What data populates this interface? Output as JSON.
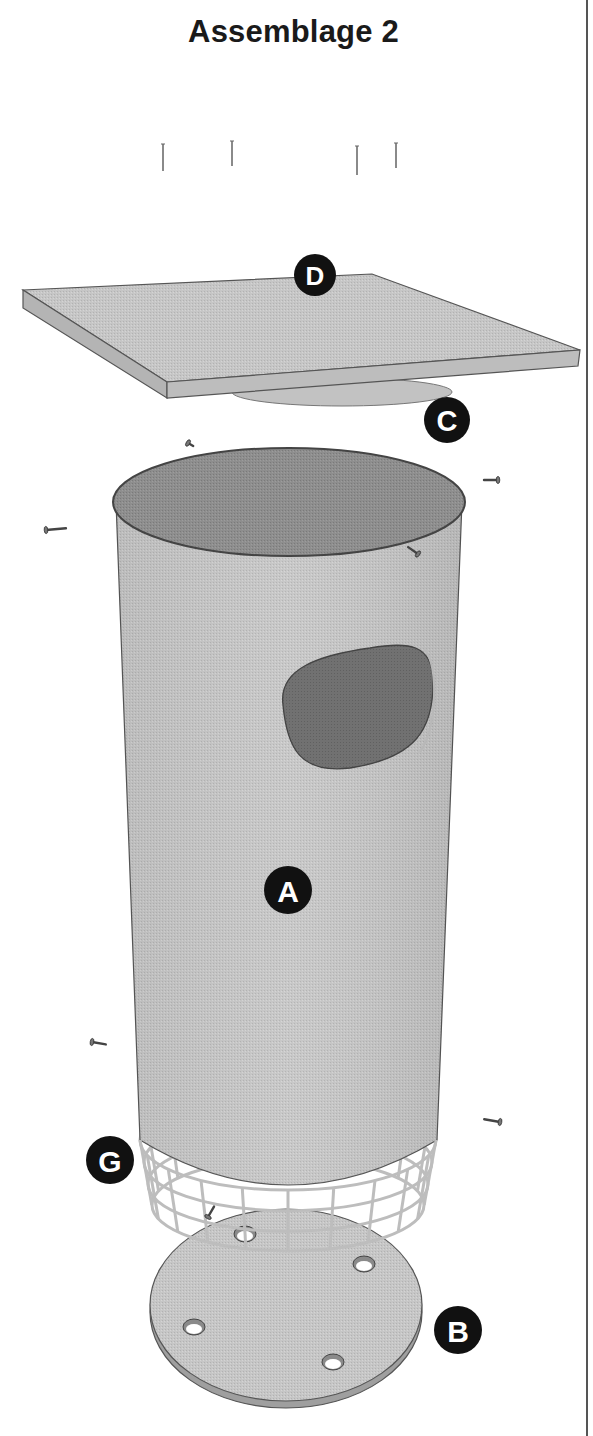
{
  "header": {
    "title": "Assemblage 2"
  },
  "colors": {
    "ink": "#1a1a1a",
    "panel": "#c9c9c9",
    "panel_edge": "#a9a9a9",
    "cylinder_body": "#c4c4c4",
    "cylinder_top": "#8c8c8c",
    "hole": "#6e6e6e",
    "mesh": "#c8c8c8",
    "label_bg": "#111111",
    "label_fg": "#ffffff",
    "divider": "#555555"
  },
  "parts": [
    {
      "id": "D",
      "name": "roof-panel",
      "label": "D",
      "cx": 315,
      "cy": 275,
      "r": 21
    },
    {
      "id": "C",
      "name": "roof-disc",
      "label": "C",
      "cx": 447,
      "cy": 420,
      "r": 23
    },
    {
      "id": "A",
      "name": "tube-body",
      "label": "A",
      "cx": 288,
      "cy": 890,
      "r": 24
    },
    {
      "id": "G",
      "name": "wire-mesh-guard",
      "label": "G",
      "cx": 110,
      "cy": 1160,
      "r": 24
    },
    {
      "id": "B",
      "name": "base-plate",
      "label": "B",
      "cx": 458,
      "cy": 1330,
      "r": 24
    }
  ],
  "nails": [
    {
      "x": 163,
      "y1": 144,
      "y2": 171
    },
    {
      "x": 232,
      "y1": 141,
      "y2": 166
    },
    {
      "x": 357,
      "y1": 146,
      "y2": 175
    },
    {
      "x": 396,
      "y1": 143,
      "y2": 168
    }
  ],
  "screws": [
    {
      "x": 188,
      "y": 443,
      "angle": 30,
      "len": 6
    },
    {
      "x": 498,
      "y": 480,
      "angle": 180,
      "len": 14
    },
    {
      "x": 46,
      "y": 530,
      "angle": -5,
      "len": 20
    },
    {
      "x": 418,
      "y": 554,
      "angle": 215,
      "len": 12
    },
    {
      "x": 92,
      "y": 1042,
      "angle": 10,
      "len": 14
    },
    {
      "x": 500,
      "y": 1122,
      "angle": 190,
      "len": 16
    },
    {
      "x": 208,
      "y": 1217,
      "angle": -60,
      "len": 12
    }
  ],
  "base_holes": [
    {
      "cx": 245,
      "cy": 1234
    },
    {
      "cx": 364,
      "cy": 1264
    },
    {
      "cx": 194,
      "cy": 1327
    },
    {
      "cx": 333,
      "cy": 1362
    }
  ]
}
